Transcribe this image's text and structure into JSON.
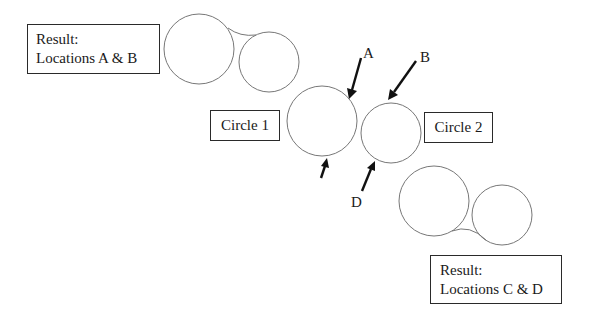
{
  "diagram": {
    "title": "",
    "boxes": {
      "result_ab": {
        "line1": "Result:",
        "line2": "Locations A & B"
      },
      "circle1": {
        "label": "Circle 1"
      },
      "circle2": {
        "label": "Circle 2"
      },
      "result_cd": {
        "line1": "Result:",
        "line2": "Locations C & D"
      }
    },
    "points": {
      "a": "A",
      "b": "B",
      "c": "",
      "d": "D"
    },
    "colors": {
      "circle_stroke": "#777777",
      "arrow": "#111111",
      "box_border": "#2a2a2a",
      "text": "#1a1a1a"
    }
  }
}
